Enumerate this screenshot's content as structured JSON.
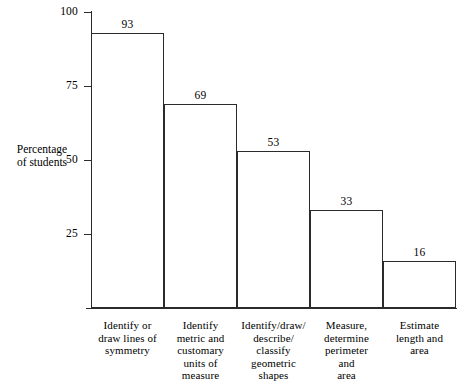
{
  "chart_data": {
    "type": "bar",
    "title": "",
    "subtitle": "",
    "xlabel": "",
    "ylabel": "Percentage of students",
    "ylabel_lines": [
      "Percentage",
      "of students"
    ],
    "categories": [
      "Identify or draw lines of symmetry",
      "Identify metric and customary units of measure",
      "Identify/draw/describe/classify geometric shapes",
      "Measure, determine perimeter and area",
      "Estimate length and area"
    ],
    "category_label_lines": [
      [
        "Identify or",
        "draw lines of",
        "symmetry"
      ],
      [
        "Identify",
        "metric and",
        "customary",
        "units of",
        "measure"
      ],
      [
        "Identify/draw/",
        "describe/",
        "classify",
        "geometric",
        "shapes"
      ],
      [
        "Measure,",
        "determine",
        "perimeter",
        "and",
        "area"
      ],
      [
        "Estimate",
        "length and",
        "area"
      ]
    ],
    "values": [
      93,
      69,
      53,
      33,
      16
    ],
    "value_labels": [
      "93",
      "69",
      "53",
      "33",
      "16"
    ],
    "ylim": [
      0,
      100
    ],
    "yticks": [
      25,
      50,
      75,
      100
    ],
    "ytick_labels": [
      "25",
      "50",
      "75",
      "100"
    ],
    "grid": false,
    "legend": null,
    "legend_position": "none",
    "bar_style": "outline",
    "colors": {
      "background": "#ffffff",
      "axis": "#2b2b2b",
      "bar_edge": "#2b2b2b",
      "bar_fill": "#ffffff",
      "text": "#000000"
    }
  }
}
